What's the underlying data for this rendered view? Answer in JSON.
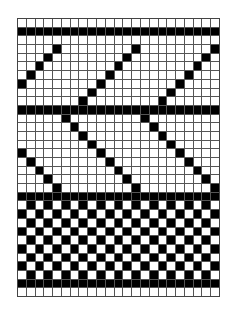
{
  "pattern": {
    "title": "",
    "columns": 23,
    "rows_count": 32,
    "colors": {
      "filled": "#000000",
      "empty": "#ffffff",
      "gridline": "#555555"
    },
    "rows": [
      ".......................",
      "#######################",
      ".......................",
      "....#........#........#",
      "...#........#........#.",
      "..#........#........#..",
      ".#........#........#...",
      "#........#........#....",
      "........#........#.....",
      ".......#........#......",
      "#######################",
      ".....#........#........",
      "......#........#.......",
      ".......#........#......",
      "........#........#.....",
      "#........#........#....",
      ".#........#........#...",
      "..#........#........#..",
      "...#........#........#.",
      "....#........#........#",
      "#######################",
      ".#.#.#.#.#.#.#.#.#.#.#.",
      "#.#.#.#.#.#.#.#.#.#.#.#",
      ".#.#.#.#.#.#.#.#.#.#.#.",
      "#.#.#.#.#.#.#.#.#.#.#.#",
      ".#.#.#.#.#.#.#.#.#.#.#.",
      "#.#.#.#.#.#.#.#.#.#.#.#",
      ".#.#.#.#.#.#.#.#.#.#.#.",
      "#.#.#.#.#.#.#.#.#.#.#.#",
      ".#.#.#.#.#.#.#.#.#.#.#.",
      "#######################",
      "......................."
    ]
  }
}
